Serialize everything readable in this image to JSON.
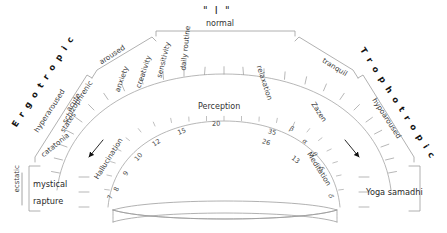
{
  "diagram": {
    "title": "\" I \"",
    "top_bracket_label": "normal",
    "center_label": "Perception",
    "axes": {
      "left": "E r g o t r o p i c",
      "right": "T r o p h o t r o p i c"
    },
    "left_branch_labels": [
      "aroused",
      "anxiety",
      "creativity",
      "sensitivity",
      "hyperaroused",
      "acute schizophrenic states",
      "catatonia",
      "Hallucination"
    ],
    "left_branch": {
      "aroused": "aroused",
      "anxiety": "anxiety",
      "creativity": "creativity",
      "sensitivity": "sensitivity",
      "hyperaroused": "hyperaroused",
      "acute": "acute",
      "schizophrenic": "schizophrenic",
      "states": "states",
      "catatonia": "catatonia",
      "hallucination": "Hallucination"
    },
    "center_branch": {
      "daily_routine": "daily routine",
      "relaxation": "relaxation"
    },
    "right_branch": {
      "tranquil": "tranquil",
      "zazen": "Zazen",
      "hypoaroused": "hypoaroused",
      "meditation": "Meditation"
    },
    "left_endbox": {
      "bracket_label": "ecstatic",
      "line1": "mystical",
      "line2": "rapture"
    },
    "right_endbox": {
      "label": "Yoga samadhi"
    },
    "arrows": {
      "left": "arrow-hallucination",
      "right": "arrow-meditation"
    }
  },
  "chart_data": {
    "type": "scatter",
    "title": "\" I \"",
    "xlabel": "Ergotropic  ↔  Trophotropic arousal continuum",
    "ylabel": "Perception",
    "grid": false,
    "legend": "none",
    "scale_name": "Perception",
    "outer_scale_labels": [
      "hyperaroused",
      "aroused",
      "normal",
      "tranquil",
      "hypoaroused"
    ],
    "inner_arc_ticks": [
      {
        "label": "7",
        "type": "number"
      },
      {
        "label": "8",
        "type": "number"
      },
      {
        "label": "9",
        "type": "number"
      },
      {
        "label": "10",
        "type": "number"
      },
      {
        "label": "12",
        "type": "number"
      },
      {
        "label": "15",
        "type": "number"
      },
      {
        "label": "20",
        "type": "number"
      },
      {
        "label": "35",
        "type": "number"
      },
      {
        "label": "26",
        "type": "number"
      },
      {
        "label": "13",
        "type": "number"
      },
      {
        "label": "β",
        "type": "greek"
      },
      {
        "label": "α",
        "type": "greek"
      },
      {
        "label": "θ",
        "type": "greek"
      },
      {
        "label": "δ",
        "type": "greek"
      },
      {
        "label": "δ",
        "type": "greek"
      }
    ],
    "states_left_to_right": [
      "mystical rapture",
      "catatonia",
      "acute schizophrenic states",
      "hyperaroused",
      "Hallucination",
      "anxiety",
      "creativity",
      "aroused",
      "sensitivity",
      "daily routine",
      "normal",
      "relaxation",
      "tranquil",
      "Zazen",
      "Meditation",
      "hypoaroused",
      "Yoga samadhi"
    ],
    "colors": {
      "line": "#9a9a9a",
      "text": "#3a3a3a",
      "arrow": "#111111"
    }
  }
}
